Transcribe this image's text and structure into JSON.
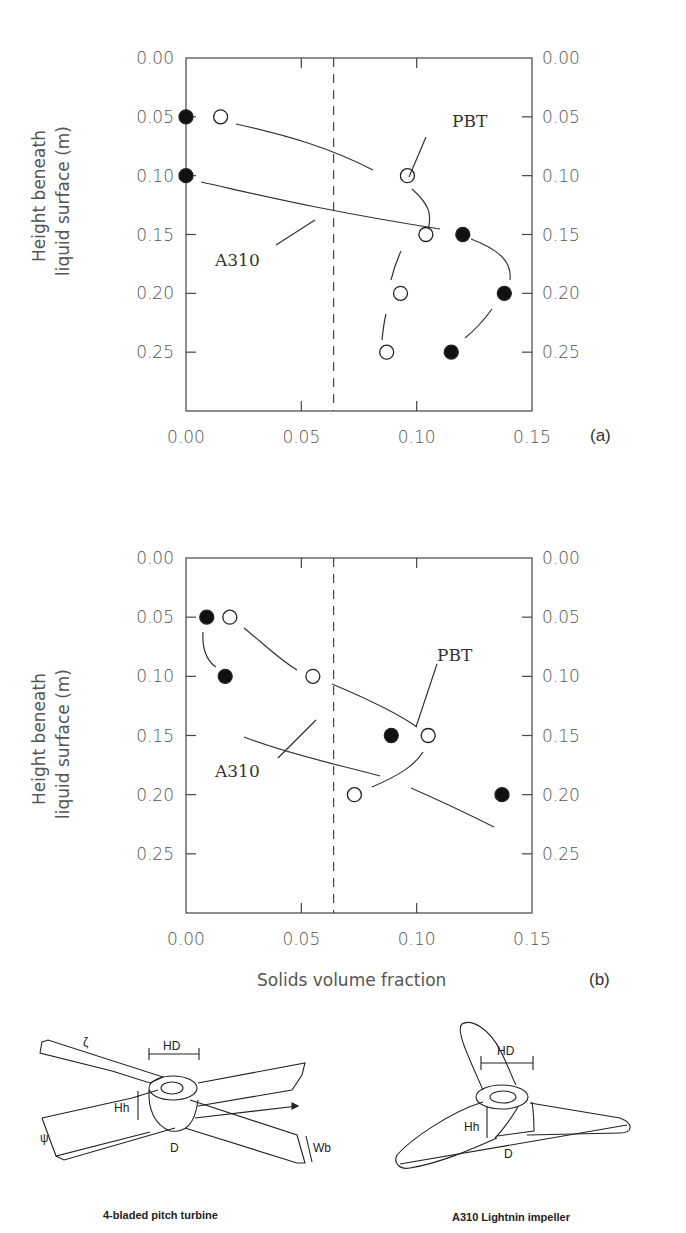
{
  "chart_data": [
    {
      "type": "scatter",
      "panel_label": "(a)",
      "title": "",
      "xlabel": "",
      "ylabel": "Height beneath liquid surface (m)",
      "xlim": [
        0.0,
        0.15
      ],
      "ylim": [
        0.0,
        0.3
      ],
      "y_inverted": true,
      "x_ticks": [
        "0.00",
        "0.05",
        "0.10",
        "0.15"
      ],
      "y_ticks": [
        "0.00",
        "0.05",
        "0.10",
        "0.15",
        "0.20",
        "0.25"
      ],
      "reference_line": {
        "style": "dashed",
        "x": 0.064
      },
      "series": [
        {
          "name": "PBT",
          "marker": "open-circle",
          "points": [
            [
              0.015,
              0.05
            ],
            [
              0.096,
              0.1
            ],
            [
              0.104,
              0.15
            ],
            [
              0.093,
              0.2
            ],
            [
              0.087,
              0.25
            ]
          ]
        },
        {
          "name": "A310",
          "marker": "filled-circle",
          "points": [
            [
              0.0,
              0.05
            ],
            [
              0.0,
              0.1
            ],
            [
              0.12,
              0.15
            ],
            [
              0.138,
              0.2
            ],
            [
              0.115,
              0.25
            ]
          ]
        }
      ],
      "annotations": [
        "PBT",
        "A310"
      ]
    },
    {
      "type": "scatter",
      "panel_label": "(b)",
      "title": "",
      "xlabel": "Solids volume fraction",
      "ylabel": "Height beneath liquid surface (m)",
      "xlim": [
        0.0,
        0.15
      ],
      "ylim": [
        0.0,
        0.3
      ],
      "y_inverted": true,
      "x_ticks": [
        "0.00",
        "0.05",
        "0.10",
        "0.15"
      ],
      "y_ticks": [
        "0.00",
        "0.05",
        "0.10",
        "0.15",
        "0.20",
        "0.25"
      ],
      "reference_line": {
        "style": "dashed",
        "x": 0.064
      },
      "series": [
        {
          "name": "PBT",
          "marker": "open-circle",
          "points": [
            [
              0.019,
              0.05
            ],
            [
              0.055,
              0.1
            ],
            [
              0.105,
              0.15
            ],
            [
              0.073,
              0.2
            ]
          ]
        },
        {
          "name": "A310",
          "marker": "filled-circle",
          "points": [
            [
              0.009,
              0.05
            ],
            [
              0.017,
              0.1
            ],
            [
              0.089,
              0.15
            ],
            [
              0.137,
              0.2
            ]
          ]
        }
      ],
      "annotations": [
        "PBT",
        "A310"
      ]
    }
  ],
  "labels": {
    "ylabel_line1": "Height beneath",
    "ylabel_line2": "liquid surface (m)",
    "xlabel": "Solids volume fraction",
    "panel_a": "(a)",
    "panel_b": "(b)",
    "pbt": "PBT",
    "a310": "A310"
  },
  "diagrams": {
    "left_caption": "4-bladed pitch turbine",
    "right_caption": "A310 Lightnin impeller",
    "dim_hd": "HD",
    "dim_hh": "Hh",
    "dim_d": "D",
    "dim_wb": "Wb",
    "dim_zeta": "ζ",
    "dim_psi": "ψ"
  }
}
